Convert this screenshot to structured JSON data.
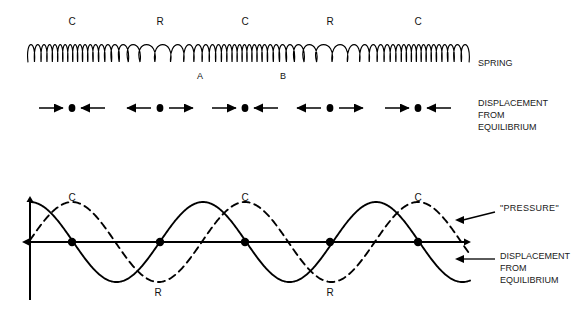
{
  "figure": {
    "background": "#ffffff",
    "ink": "#000000",
    "width": 572,
    "height": 322
  },
  "spring_section": {
    "side_label": "SPRING",
    "region_labels": [
      {
        "text": "C",
        "x": 72,
        "y": 18
      },
      {
        "text": "R",
        "x": 160,
        "y": 18
      },
      {
        "text": "C",
        "x": 245,
        "y": 18
      },
      {
        "text": "R",
        "x": 330,
        "y": 18
      },
      {
        "text": "C",
        "x": 418,
        "y": 18
      }
    ],
    "point_labels": [
      {
        "text": "A",
        "x": 200,
        "y": 72
      },
      {
        "text": "B",
        "x": 283,
        "y": 72
      }
    ],
    "geometry": {
      "x_start": 28,
      "x_end": 470,
      "baseline_y": 62,
      "coil_height": 22,
      "coil_count": 62,
      "compression_centers": [
        72,
        245,
        418
      ],
      "rarefaction_centers": [
        160,
        330
      ]
    }
  },
  "displacement_section": {
    "side_label": "DISPLACEMENT\nFROM\nEQUILIBRIUM",
    "side_label_x": 478,
    "side_label_y": 98,
    "row_y": 108,
    "groups": [
      {
        "center_x": 72,
        "type": "compression",
        "left_arrow_dir": "right",
        "right_arrow_dir": "left"
      },
      {
        "center_x": 160,
        "type": "rarefaction",
        "left_arrow_dir": "left",
        "right_arrow_dir": "right"
      },
      {
        "center_x": 245,
        "type": "compression",
        "left_arrow_dir": "right",
        "right_arrow_dir": "left"
      },
      {
        "center_x": 330,
        "type": "rarefaction",
        "left_arrow_dir": "left",
        "right_arrow_dir": "right"
      },
      {
        "center_x": 418,
        "type": "compression",
        "left_arrow_dir": "right",
        "right_arrow_dir": "left"
      }
    ]
  },
  "graph_section": {
    "axis": {
      "origin_x": 30,
      "baseline_y": 242,
      "y_axis_top": 200,
      "y_axis_bottom": 300,
      "x_axis_end": 464
    },
    "curve_labels_c": [
      {
        "text": "C",
        "x": 72,
        "y": 193
      },
      {
        "text": "C",
        "x": 245,
        "y": 193
      },
      {
        "text": "C",
        "x": 418,
        "y": 193
      }
    ],
    "curve_labels_r": [
      {
        "text": "R",
        "x": 158,
        "y": 288
      },
      {
        "text": "R",
        "x": 330,
        "y": 288
      }
    ],
    "node_dots": [
      {
        "x": 72,
        "y": 242
      },
      {
        "x": 160,
        "y": 242
      },
      {
        "x": 245,
        "y": 242
      },
      {
        "x": 330,
        "y": 242
      },
      {
        "x": 418,
        "y": 242
      }
    ],
    "annotations": [
      {
        "id": "pressure",
        "text": "\"PRESSURE\"",
        "text_x": 500,
        "text_y": 208,
        "arrow_from_x": 495,
        "arrow_from_y": 212,
        "arrow_to_x": 455,
        "arrow_to_y": 220
      },
      {
        "id": "displacement",
        "text": "DISPLACEMENT\nFROM\nEQUILIBRIUM",
        "text_x": 500,
        "text_y": 255,
        "arrow_from_x": 495,
        "arrow_from_y": 259,
        "arrow_to_x": 455,
        "arrow_to_y": 259
      }
    ]
  },
  "chart_data": {
    "type": "line",
    "xlabel": "",
    "ylabel": "",
    "grid": false,
    "legend_position": "right-annotations",
    "x_range": [
      0,
      464
    ],
    "y_range": [
      -1,
      1
    ],
    "wavelength_px": 173,
    "amplitude_px": 40,
    "series": [
      {
        "name": "DISPLACEMENT FROM EQUILIBRIUM",
        "style": "solid",
        "color": "#000000",
        "phase_description": "cosine: starts at positive peak at x=30",
        "zero_crossings_px": [
          72,
          160,
          245,
          330,
          418
        ],
        "peaks_px": [
          30,
          203,
          376
        ],
        "troughs_px": [
          116,
          289,
          462
        ]
      },
      {
        "name": "\"PRESSURE\"",
        "style": "dashed",
        "color": "#000000",
        "phase_description": "sine: starts at zero rising at x=30, quarter-wave ahead",
        "zero_crossings_px": [
          30,
          116,
          203,
          289,
          376,
          462
        ],
        "peaks_px": [
          72,
          245,
          418
        ],
        "troughs_px": [
          158,
          330
        ]
      }
    ],
    "annotations": [
      {
        "label": "C",
        "meaning": "compression",
        "x_px": [
          72,
          245,
          418
        ]
      },
      {
        "label": "R",
        "meaning": "rarefaction",
        "x_px": [
          158,
          330
        ]
      }
    ]
  }
}
